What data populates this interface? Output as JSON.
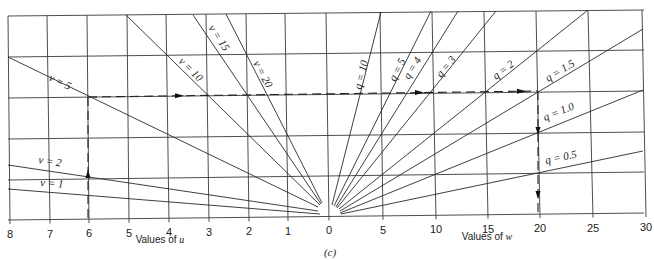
{
  "figure": {
    "caption": "(c)",
    "u_axis_title": "Values of ",
    "u_axis_var": "u",
    "w_axis_title": "Values of ",
    "w_axis_var": "w"
  },
  "axes": {
    "u_ticks": [
      {
        "label": "8",
        "bx": 10,
        "tx": 8
      },
      {
        "label": "7",
        "bx": 50,
        "tx": 47
      },
      {
        "label": "6",
        "bx": 89,
        "tx": 87
      },
      {
        "label": "5",
        "bx": 129,
        "tx": 127
      },
      {
        "label": "4",
        "bx": 169,
        "tx": 166
      },
      {
        "label": "3",
        "bx": 209,
        "tx": 206
      },
      {
        "label": "2",
        "bx": 249,
        "tx": 246
      },
      {
        "label": "1",
        "bx": 288,
        "tx": 285
      },
      {
        "label": "0",
        "bx": 329,
        "tx": 326
      }
    ],
    "w_ticks": [
      {
        "label": "5",
        "bx": 383,
        "tx": 380
      },
      {
        "label": "10",
        "bx": 436,
        "tx": 432
      },
      {
        "label": "15",
        "bx": 488,
        "tx": 484
      },
      {
        "label": "20",
        "bx": 540,
        "tx": 536
      },
      {
        "label": "25",
        "bx": 593,
        "tx": 588
      },
      {
        "label": "30",
        "bx": 646,
        "tx": 642
      }
    ],
    "horizontal_gridlines": [
      {
        "yl": 16,
        "yr": 10
      },
      {
        "yl": 57,
        "yr": 50
      },
      {
        "yl": 98,
        "yr": 91
      },
      {
        "yl": 139,
        "yr": 132
      },
      {
        "yl": 180,
        "yr": 172
      },
      {
        "yl": 220,
        "yr": 213
      }
    ]
  },
  "v_lines": [
    {
      "label": "v = 1",
      "x1": 8,
      "y1": 189,
      "x2": 320,
      "y2": 214,
      "lx": 40,
      "ly": 186,
      "rot": 4
    },
    {
      "label": "v = 2",
      "x1": 8,
      "y1": 165,
      "x2": 318,
      "y2": 211,
      "lx": 38,
      "ly": 163,
      "rot": 9
    },
    {
      "label": "v = 5",
      "x1": 8,
      "y1": 57,
      "x2": 318,
      "y2": 207,
      "lx": 48,
      "ly": 80,
      "rot": 26
    },
    {
      "label": "v = 10",
      "x1": 126,
      "y1": 15,
      "x2": 320,
      "y2": 205,
      "lx": 178,
      "ly": 62,
      "rot": 44
    },
    {
      "label": "v = 15",
      "x1": 193,
      "y1": 15,
      "x2": 321,
      "y2": 204,
      "lx": 208,
      "ly": 28,
      "rot": 56
    },
    {
      "label": "v = 20",
      "x1": 226,
      "y1": 14,
      "x2": 322,
      "y2": 203,
      "lx": 253,
      "ly": 63,
      "rot": 62
    }
  ],
  "q_lines": [
    {
      "label": "q = 10",
      "x1": 381,
      "y1": 12,
      "x2": 332,
      "y2": 205,
      "lx": 361,
      "ly": 90,
      "rot": -76
    },
    {
      "label": "q = 5",
      "x1": 431,
      "y1": 11,
      "x2": 334,
      "y2": 206,
      "lx": 395,
      "ly": 82,
      "rot": -63
    },
    {
      "label": "q = 4",
      "x1": 458,
      "y1": 11,
      "x2": 336,
      "y2": 207,
      "lx": 409,
      "ly": 80,
      "rot": -58
    },
    {
      "label": "q = 3",
      "x1": 496,
      "y1": 11,
      "x2": 337,
      "y2": 208,
      "lx": 441,
      "ly": 78,
      "rot": -50
    },
    {
      "label": "q = 2",
      "x1": 588,
      "y1": 10,
      "x2": 339,
      "y2": 209,
      "lx": 496,
      "ly": 80,
      "rot": -38
    },
    {
      "label": "q = 1.5",
      "x1": 643,
      "y1": 29,
      "x2": 340,
      "y2": 211,
      "lx": 548,
      "ly": 82,
      "rot": -31
    },
    {
      "label": "q = 1.0",
      "x1": 643,
      "y1": 90,
      "x2": 340,
      "y2": 213,
      "lx": 545,
      "ly": 121,
      "rot": -22
    },
    {
      "label": "q = 0.5",
      "x1": 643,
      "y1": 151,
      "x2": 341,
      "y2": 214,
      "lx": 546,
      "ly": 164,
      "rot": -12
    }
  ],
  "example_path": {
    "vertical_u": {
      "x": 88,
      "y_top": 97,
      "y_bottom": 218,
      "arrow_y": 175
    },
    "horizontal": {
      "y_left": 97,
      "y_right": 91,
      "x_left": 88,
      "x_right": 538,
      "arrows_x": [
        180,
        420,
        522
      ]
    },
    "vertical_w": {
      "x": 538,
      "y_top": 91,
      "y_bottom": 214,
      "arrow_ys": [
        130,
        194
      ]
    }
  }
}
